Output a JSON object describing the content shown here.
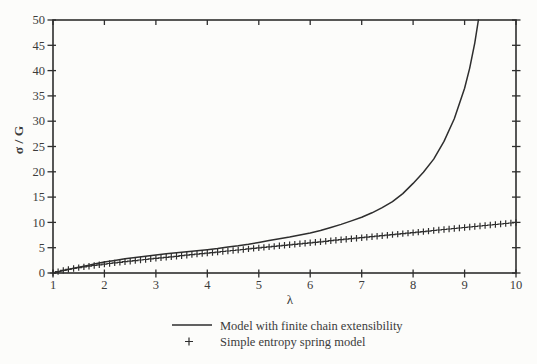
{
  "figure": {
    "background": "#fcfcfa",
    "ink_color": "#2e2e2e",
    "text_color": "#3b3b3b"
  },
  "chart_data": {
    "type": "line",
    "title": "",
    "xlabel": "λ",
    "ylabel": "σ / G",
    "xlim": [
      1,
      10
    ],
    "ylim": [
      0,
      50
    ],
    "x_ticks": [
      1,
      2,
      3,
      4,
      5,
      6,
      7,
      8,
      9,
      10
    ],
    "y_ticks": [
      0,
      5,
      10,
      15,
      20,
      25,
      30,
      35,
      40,
      45,
      50
    ],
    "grid": false,
    "legend_position": "below-chart",
    "series": [
      {
        "name": "Model with finite chain extensibility",
        "style": "solid",
        "marker": "none",
        "x": [
          1,
          1.1,
          1.2,
          1.3,
          1.4,
          1.5,
          1.6,
          1.7,
          1.8,
          1.9,
          2,
          2.2,
          2.4,
          2.6,
          2.8,
          3,
          3.2,
          3.4,
          3.6,
          3.8,
          4,
          4.2,
          4.4,
          4.6,
          4.8,
          5,
          5.2,
          5.4,
          5.6,
          5.8,
          6,
          6.2,
          6.4,
          6.6,
          6.8,
          7,
          7.2,
          7.4,
          7.6,
          7.8,
          8,
          8.2,
          8.4,
          8.6,
          8.8,
          9,
          9.1,
          9.2,
          9.27
        ],
        "y": [
          0,
          0.25,
          0.5,
          0.72,
          0.95,
          1.15,
          1.35,
          1.55,
          1.75,
          1.95,
          2.15,
          2.5,
          2.8,
          3.05,
          3.3,
          3.55,
          3.8,
          4.0,
          4.2,
          4.4,
          4.6,
          4.85,
          5.15,
          5.4,
          5.7,
          6.05,
          6.4,
          6.75,
          7.1,
          7.5,
          7.9,
          8.4,
          9.0,
          9.6,
          10.3,
          11.0,
          11.9,
          12.9,
          14.1,
          15.7,
          17.7,
          19.9,
          22.5,
          26.0,
          30.5,
          36.5,
          40.5,
          45.5,
          50
        ]
      },
      {
        "name": "Simple entropy spring model",
        "style": "markers-only",
        "marker": "+",
        "x_start": 1.0,
        "x_step": 0.1,
        "y": [
          0,
          0.27,
          0.51,
          0.71,
          0.89,
          1.06,
          1.21,
          1.35,
          1.49,
          1.62,
          1.75,
          1.87,
          1.99,
          2.11,
          2.23,
          2.34,
          2.45,
          2.56,
          2.67,
          2.78,
          2.89,
          3.0,
          3.1,
          3.21,
          3.31,
          3.42,
          3.52,
          3.63,
          3.73,
          3.83,
          3.94,
          4.04,
          4.14,
          4.25,
          4.35,
          4.45,
          4.55,
          4.65,
          4.76,
          4.86,
          4.96,
          5.06,
          5.16,
          5.26,
          5.37,
          5.47,
          5.57,
          5.67,
          5.77,
          5.87,
          5.97,
          6.07,
          6.17,
          6.27,
          6.38,
          6.48,
          6.58,
          6.68,
          6.78,
          6.88,
          6.98,
          7.08,
          7.18,
          7.28,
          7.38,
          7.48,
          7.58,
          7.68,
          7.78,
          7.88,
          7.98,
          8.08,
          8.19,
          8.29,
          8.39,
          8.49,
          8.59,
          8.69,
          8.79,
          8.89,
          8.99,
          9.09,
          9.19,
          9.29,
          9.39,
          9.49,
          9.59,
          9.69,
          9.79,
          9.89,
          9.99
        ]
      }
    ]
  }
}
